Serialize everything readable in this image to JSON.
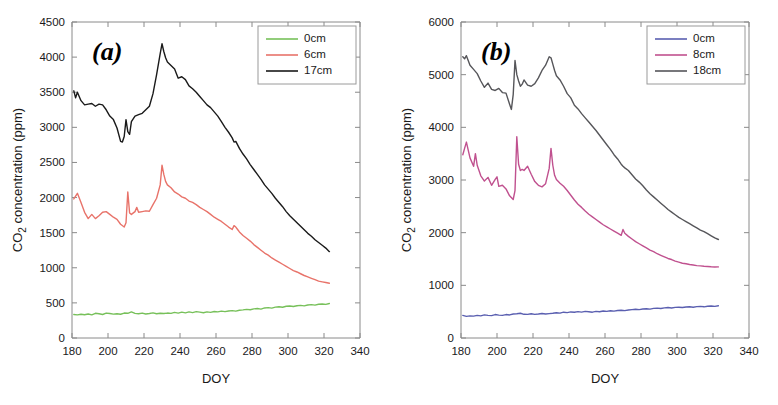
{
  "figure": {
    "title": "",
    "panels": [
      "a",
      "b"
    ]
  },
  "chart_data": [
    {
      "type": "line",
      "panel_label": "(a)",
      "title": "",
      "xlabel": "DOY",
      "ylabel": "CO2 concentration (ppm)",
      "ylabel_base": "CO",
      "ylabel_sub": "2",
      "ylabel_rest": " concentration (ppm)",
      "xlim": [
        180,
        340
      ],
      "ylim": [
        0,
        4500
      ],
      "xticks": [
        180,
        200,
        220,
        240,
        260,
        280,
        300,
        320,
        340
      ],
      "yticks": [
        0,
        500,
        1000,
        1500,
        2000,
        2500,
        3000,
        3500,
        4000,
        4500
      ],
      "grid": false,
      "legend_position": "top-right",
      "series": [
        {
          "name": "0cm",
          "color": "#77c05a",
          "x": [
            181,
            183,
            185,
            187,
            189,
            191,
            193,
            195,
            197,
            199,
            201,
            203,
            205,
            207,
            209,
            211,
            213,
            215,
            217,
            219,
            221,
            223,
            225,
            227,
            229,
            231,
            233,
            235,
            237,
            239,
            241,
            243,
            245,
            247,
            249,
            251,
            253,
            255,
            257,
            259,
            261,
            263,
            265,
            267,
            269,
            271,
            273,
            275,
            277,
            279,
            281,
            283,
            285,
            287,
            289,
            291,
            293,
            295,
            297,
            299,
            301,
            303,
            305,
            307,
            309,
            311,
            313,
            315,
            317,
            319,
            321,
            323
          ],
          "values": [
            335,
            330,
            338,
            332,
            342,
            330,
            352,
            345,
            335,
            355,
            348,
            340,
            345,
            338,
            355,
            352,
            372,
            350,
            345,
            355,
            342,
            348,
            358,
            345,
            352,
            348,
            355,
            350,
            365,
            355,
            368,
            358,
            372,
            362,
            375,
            368,
            360,
            372,
            365,
            378,
            372,
            382,
            375,
            385,
            390,
            382,
            395,
            400,
            408,
            402,
            415,
            420,
            412,
            428,
            432,
            425,
            440,
            445,
            438,
            452,
            455,
            448,
            460,
            465,
            458,
            470,
            475,
            468,
            480,
            485,
            478,
            492
          ]
        },
        {
          "name": "6cm",
          "color": "#e8736a",
          "x": [
            181,
            183,
            185,
            187,
            189,
            191,
            193,
            195,
            197,
            199,
            201,
            203,
            205,
            207,
            209,
            210,
            211,
            212,
            213,
            215,
            216,
            217,
            219,
            221,
            223,
            225,
            227,
            229,
            230,
            231,
            232,
            233,
            235,
            237,
            239,
            241,
            243,
            245,
            247,
            249,
            251,
            253,
            255,
            257,
            259,
            261,
            263,
            265,
            267,
            269,
            270,
            271,
            272,
            273,
            275,
            277,
            279,
            281,
            283,
            285,
            287,
            289,
            291,
            293,
            295,
            297,
            299,
            301,
            303,
            305,
            307,
            309,
            311,
            313,
            315,
            317,
            319,
            321,
            323
          ],
          "values": [
            1980,
            2060,
            1930,
            1790,
            1700,
            1760,
            1700,
            1740,
            1790,
            1800,
            1760,
            1720,
            1690,
            1620,
            1580,
            1640,
            2080,
            1780,
            1760,
            1800,
            1860,
            1790,
            1800,
            1810,
            1805,
            1900,
            1990,
            2180,
            2460,
            2330,
            2230,
            2180,
            2140,
            2080,
            2050,
            2010,
            1990,
            1950,
            1930,
            1900,
            1860,
            1830,
            1800,
            1760,
            1720,
            1690,
            1660,
            1620,
            1580,
            1545,
            1600,
            1580,
            1545,
            1510,
            1460,
            1420,
            1380,
            1330,
            1290,
            1250,
            1210,
            1180,
            1140,
            1110,
            1080,
            1050,
            1020,
            990,
            960,
            940,
            915,
            890,
            870,
            850,
            830,
            810,
            800,
            790,
            780
          ]
        },
        {
          "name": "17cm",
          "color": "#1a1a1a",
          "x": [
            181,
            182,
            183,
            185,
            187,
            189,
            191,
            193,
            195,
            197,
            199,
            201,
            203,
            205,
            207,
            208,
            209,
            210,
            211,
            212,
            213,
            214,
            215,
            217,
            219,
            221,
            223,
            225,
            227,
            229,
            230,
            231,
            232,
            233,
            235,
            237,
            239,
            241,
            243,
            245,
            247,
            249,
            251,
            253,
            255,
            257,
            259,
            261,
            263,
            265,
            267,
            269,
            270,
            271,
            273,
            275,
            277,
            279,
            281,
            283,
            285,
            287,
            289,
            291,
            293,
            295,
            297,
            299,
            301,
            303,
            305,
            307,
            309,
            311,
            313,
            315,
            317,
            319,
            321,
            323
          ],
          "values": [
            3520,
            3420,
            3500,
            3380,
            3320,
            3330,
            3340,
            3300,
            3330,
            3320,
            3250,
            3160,
            3110,
            2990,
            2800,
            2790,
            2870,
            3110,
            2940,
            2900,
            3080,
            3120,
            3160,
            3180,
            3200,
            3250,
            3300,
            3480,
            3750,
            4050,
            4190,
            4080,
            3990,
            3930,
            3880,
            3830,
            3700,
            3720,
            3680,
            3590,
            3550,
            3500,
            3440,
            3380,
            3320,
            3280,
            3220,
            3160,
            3080,
            3000,
            2930,
            2850,
            2790,
            2800,
            2700,
            2620,
            2550,
            2470,
            2400,
            2330,
            2260,
            2180,
            2120,
            2060,
            1990,
            1930,
            1870,
            1800,
            1740,
            1690,
            1640,
            1590,
            1540,
            1490,
            1450,
            1400,
            1360,
            1320,
            1280,
            1230
          ]
        }
      ]
    },
    {
      "type": "line",
      "panel_label": "(b)",
      "title": "",
      "xlabel": "DOY",
      "ylabel": "CO2 concentration (ppm)",
      "ylabel_base": "CO",
      "ylabel_sub": "2",
      "ylabel_rest": " concentration (ppm)",
      "xlim": [
        180,
        340
      ],
      "ylim": [
        0,
        6000
      ],
      "xticks": [
        180,
        200,
        220,
        240,
        260,
        280,
        300,
        320,
        340
      ],
      "yticks": [
        0,
        1000,
        2000,
        3000,
        4000,
        5000,
        6000
      ],
      "grid": false,
      "legend_position": "top-right",
      "series": [
        {
          "name": "0cm",
          "color": "#5a5fb0",
          "x": [
            181,
            183,
            185,
            187,
            189,
            191,
            193,
            195,
            197,
            199,
            201,
            203,
            205,
            207,
            209,
            211,
            213,
            215,
            217,
            219,
            221,
            223,
            225,
            227,
            229,
            231,
            233,
            235,
            237,
            239,
            241,
            243,
            245,
            247,
            249,
            251,
            253,
            255,
            257,
            259,
            261,
            263,
            265,
            267,
            269,
            271,
            273,
            275,
            277,
            279,
            281,
            283,
            285,
            287,
            289,
            291,
            293,
            295,
            297,
            299,
            301,
            303,
            305,
            307,
            309,
            311,
            313,
            315,
            317,
            319,
            321,
            323
          ],
          "values": [
            430,
            410,
            420,
            415,
            430,
            420,
            440,
            430,
            425,
            445,
            435,
            430,
            445,
            438,
            455,
            460,
            470,
            450,
            448,
            460,
            448,
            455,
            465,
            455,
            462,
            470,
            480,
            472,
            490,
            482,
            495,
            488,
            500,
            492,
            505,
            498,
            490,
            505,
            498,
            512,
            505,
            518,
            510,
            522,
            528,
            520,
            532,
            538,
            545,
            538,
            550,
            555,
            548,
            562,
            568,
            560,
            572,
            578,
            570,
            582,
            585,
            578,
            588,
            592,
            585,
            595,
            600,
            592,
            602,
            608,
            600,
            612
          ]
        },
        {
          "name": "8cm",
          "color": "#c0518f",
          "x": [
            181,
            182,
            183,
            185,
            187,
            188,
            189,
            191,
            193,
            195,
            197,
            199,
            200,
            201,
            203,
            205,
            207,
            209,
            210,
            211,
            212,
            213,
            214,
            215,
            217,
            219,
            221,
            223,
            225,
            227,
            229,
            230,
            231,
            232,
            233,
            235,
            237,
            239,
            241,
            243,
            245,
            247,
            249,
            251,
            253,
            255,
            257,
            259,
            261,
            263,
            265,
            267,
            269,
            270,
            271,
            273,
            275,
            277,
            279,
            281,
            283,
            285,
            287,
            289,
            291,
            293,
            295,
            297,
            299,
            301,
            303,
            305,
            307,
            309,
            311,
            313,
            315,
            317,
            319,
            321,
            323
          ],
          "values": [
            3480,
            3600,
            3720,
            3420,
            3260,
            3500,
            3280,
            3080,
            2980,
            3050,
            2900,
            3010,
            3060,
            2880,
            2900,
            2830,
            2700,
            2630,
            2800,
            3820,
            3300,
            3180,
            3200,
            3180,
            3260,
            3110,
            2970,
            2900,
            2870,
            2930,
            3220,
            3600,
            3280,
            3090,
            3010,
            2940,
            2880,
            2800,
            2710,
            2620,
            2540,
            2480,
            2410,
            2350,
            2300,
            2250,
            2200,
            2150,
            2110,
            2070,
            2030,
            1990,
            1950,
            2060,
            1990,
            1930,
            1880,
            1830,
            1790,
            1750,
            1710,
            1670,
            1640,
            1600,
            1570,
            1540,
            1510,
            1490,
            1460,
            1440,
            1420,
            1410,
            1395,
            1385,
            1375,
            1370,
            1362,
            1358,
            1352,
            1348,
            1350
          ]
        },
        {
          "name": "18cm",
          "color": "#56565a",
          "x": [
            181,
            182,
            183,
            185,
            187,
            189,
            191,
            193,
            195,
            197,
            199,
            201,
            203,
            205,
            207,
            208,
            209,
            210,
            211,
            212,
            213,
            214,
            215,
            217,
            219,
            221,
            223,
            225,
            227,
            229,
            230,
            231,
            232,
            233,
            235,
            237,
            239,
            241,
            243,
            245,
            247,
            249,
            251,
            253,
            255,
            257,
            259,
            261,
            263,
            265,
            267,
            269,
            270,
            271,
            273,
            275,
            277,
            279,
            281,
            283,
            285,
            287,
            289,
            291,
            293,
            295,
            297,
            299,
            301,
            303,
            305,
            307,
            309,
            311,
            313,
            315,
            317,
            319,
            321,
            323
          ],
          "values": [
            5340,
            5300,
            5360,
            5180,
            5100,
            5020,
            4880,
            4760,
            4840,
            4720,
            4700,
            4740,
            4660,
            4650,
            4440,
            4340,
            4620,
            5270,
            5000,
            4880,
            4780,
            4820,
            4900,
            4800,
            4780,
            4830,
            4940,
            5080,
            5180,
            5340,
            5320,
            5200,
            5080,
            4980,
            4900,
            4780,
            4640,
            4560,
            4420,
            4350,
            4260,
            4180,
            4100,
            4020,
            3940,
            3850,
            3760,
            3670,
            3580,
            3480,
            3400,
            3300,
            3260,
            3230,
            3180,
            3100,
            3020,
            2960,
            2890,
            2810,
            2740,
            2680,
            2620,
            2560,
            2500,
            2440,
            2390,
            2340,
            2290,
            2250,
            2210,
            2170,
            2130,
            2090,
            2050,
            2020,
            1980,
            1940,
            1900,
            1870
          ]
        }
      ]
    }
  ]
}
